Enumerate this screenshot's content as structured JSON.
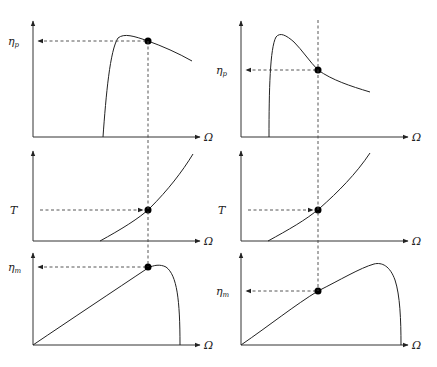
{
  "diagram": {
    "layout": "3 rows x 2 columns of curve plots linked by dashed vertical lines",
    "x_axis_label": "Ω",
    "columns": [
      {
        "name": "left",
        "operating_point_x": 148,
        "panels": [
          {
            "row": "top",
            "y_label": "η",
            "y_label_sub": "p",
            "curve": "propeller efficiency rising steeply then peaking and slowly falling; operating point just past the peak"
          },
          {
            "row": "middle",
            "y_label": "T",
            "y_label_sub": "",
            "curve": "thrust/torque increasing convexly with Ω"
          },
          {
            "row": "bottom",
            "y_label": "η",
            "y_label_sub": "m",
            "curve": "motor efficiency rising nearly linearly, peaking then dropping sharply; operating point near the peak"
          }
        ]
      },
      {
        "name": "right",
        "operating_point_x": 318,
        "panels": [
          {
            "row": "top",
            "y_label": "η",
            "y_label_sub": "p",
            "curve": "propeller efficiency with sharp early peak then decaying; operating point well past the peak"
          },
          {
            "row": "middle",
            "y_label": "T",
            "y_label_sub": "",
            "curve": "thrust/torque increasing convexly with Ω"
          },
          {
            "row": "bottom",
            "y_label": "η",
            "y_label_sub": "m",
            "curve": "motor efficiency rising linearly with late peak; operating point on rising part"
          }
        ]
      }
    ],
    "colors": {
      "line": "#222222",
      "dash": "#444444",
      "dot": "#000000",
      "background": "#ffffff"
    }
  }
}
